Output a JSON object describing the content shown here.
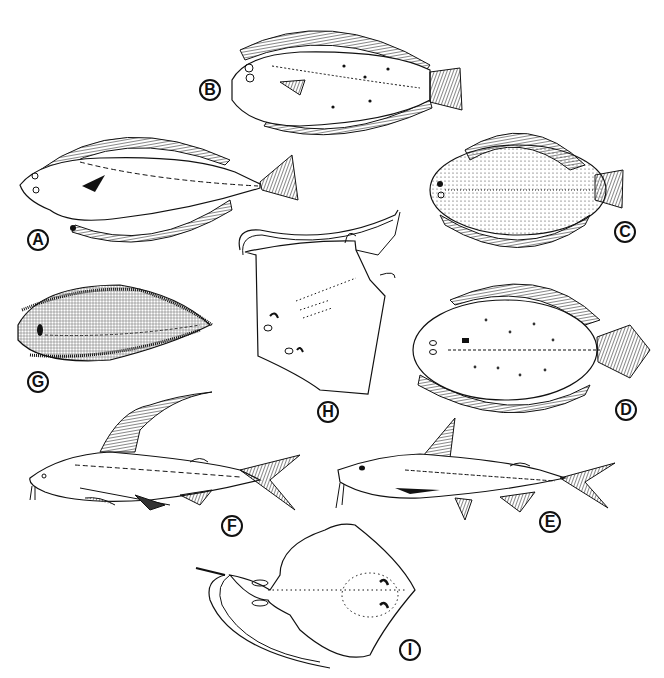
{
  "figure": {
    "background": "#ffffff",
    "ink": "#111111",
    "panels": [
      {
        "id": "A",
        "label": "A",
        "subject": "flounder (left-eyed flatfish, tapering fins)",
        "label_pos": [
          27,
          229
        ]
      },
      {
        "id": "B",
        "label": "B",
        "subject": "flounder with spots and dotted lateral line",
        "label_pos": [
          199,
          79
        ]
      },
      {
        "id": "C",
        "label": "C",
        "subject": "sole with stippled body and banding",
        "label_pos": [
          614,
          221
        ]
      },
      {
        "id": "D",
        "label": "D",
        "subject": "flounder with scattered spots",
        "label_pos": [
          615,
          399
        ]
      },
      {
        "id": "E",
        "label": "E",
        "subject": "sea catfish",
        "label_pos": [
          539,
          511
        ]
      },
      {
        "id": "F",
        "label": "F",
        "subject": "gafftopsail catfish with long dorsal filament",
        "label_pos": [
          221,
          515
        ]
      },
      {
        "id": "G",
        "label": "G",
        "subject": "tonguefish with cross-hatched body",
        "label_pos": [
          27,
          371
        ]
      },
      {
        "id": "H",
        "label": "H",
        "subject": "guitarfish/skate (dorsal view, angled)",
        "label_pos": [
          317,
          401
        ]
      },
      {
        "id": "I",
        "label": "I",
        "subject": "stingray/skate with long tail (ventral view)",
        "label_pos": [
          399,
          639
        ]
      }
    ]
  }
}
